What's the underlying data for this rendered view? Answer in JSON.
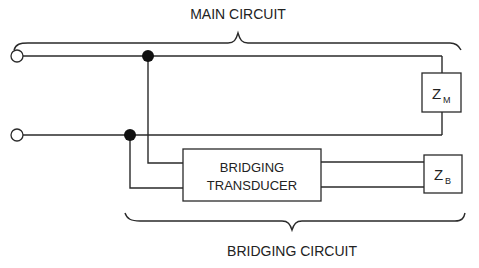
{
  "labels": {
    "main_circuit": "MAIN CIRCUIT",
    "bridging_circuit": "BRIDGING CIRCUIT",
    "transducer_line1": "BRIDGING",
    "transducer_line2": "TRANSDUCER",
    "zm_main": "Z",
    "zm_sub": "M",
    "zb_main": "Z",
    "zb_sub": "B"
  },
  "colors": {
    "line": "#2a2a2a",
    "background": "#ffffff"
  }
}
